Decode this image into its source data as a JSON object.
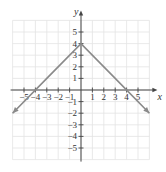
{
  "chart_data": {
    "type": "line",
    "title": "",
    "xlabel": "x",
    "ylabel": "y",
    "xlim": [
      -6,
      6
    ],
    "ylim": [
      -6,
      6
    ],
    "grid": true,
    "x_ticks": [
      -5,
      -4,
      -3,
      -2,
      -1,
      1,
      2,
      3,
      4,
      5
    ],
    "y_ticks": [
      -5,
      -4,
      -3,
      -2,
      -1,
      1,
      2,
      3,
      4,
      5
    ],
    "x_tick_labels": [
      "−5",
      "−4",
      "−3",
      "−2",
      "−1",
      "1",
      "2",
      "3",
      "4",
      "5"
    ],
    "y_tick_labels": [
      "−5",
      "−4",
      "−3",
      "−2",
      "−1",
      "1",
      "2",
      "3",
      "4",
      "5"
    ],
    "series": [
      {
        "name": "y = -|x| + 4",
        "x": [
          -6,
          -3,
          0,
          3,
          6
        ],
        "y": [
          -2,
          1,
          4,
          1,
          -2
        ],
        "points": [
          [
            -6,
            -2
          ],
          [
            -3,
            1
          ],
          [
            0,
            4
          ],
          [
            3,
            1
          ],
          [
            6,
            -2
          ]
        ],
        "arrows_at_ends": true,
        "color": "#888888"
      }
    ],
    "x_intercepts": [
      -3,
      3
    ],
    "y_intercept": 4,
    "vertex": [
      0,
      4
    ]
  },
  "colors": {
    "grid": "#e3e3e3",
    "axis": "#444444",
    "curve": "#8a8a8a",
    "text": "#333333"
  }
}
